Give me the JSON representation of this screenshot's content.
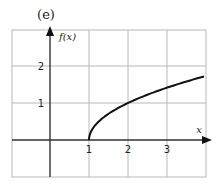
{
  "chart_data": {
    "type": "line",
    "panel_label": "(e)",
    "title": "",
    "xlabel": "x",
    "ylabel": "f(x)",
    "xlim": [
      -1,
      3.95
    ],
    "ylim": [
      -1,
      3
    ],
    "xticks": [
      1,
      2,
      3
    ],
    "yticks": [
      1,
      2
    ],
    "xtick_labels": [
      "1",
      "2",
      "3"
    ],
    "ytick_labels": [
      "1",
      "2"
    ],
    "grid": true,
    "legend": null,
    "series": [
      {
        "name": "f(x)",
        "description": "square-root shaped curve starting at (1, 0), increasing and concave down",
        "x": [
          1,
          1.1,
          1.25,
          1.5,
          2,
          2.5,
          3,
          3.5,
          3.95
        ],
        "y": [
          0,
          0.32,
          0.5,
          0.71,
          1.0,
          1.22,
          1.41,
          1.58,
          1.72
        ],
        "color": "#111111"
      }
    ],
    "colors": {
      "grid": "#b8b8b8",
      "axis": "#333333",
      "curve": "#111111",
      "frame": "#b8b8b8"
    }
  }
}
